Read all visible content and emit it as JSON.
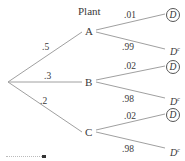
{
  "diagram": {
    "type": "probability-tree",
    "header": "Plant",
    "root_branches": [
      {
        "node": "A",
        "prob": ".5",
        "children": [
          {
            "label": "D",
            "circled": true,
            "prob": ".01"
          },
          {
            "label": "D",
            "sup": "c",
            "circled": false,
            "prob": ".99"
          }
        ]
      },
      {
        "node": "B",
        "prob": ".3",
        "children": [
          {
            "label": "D",
            "circled": true,
            "prob": ".02"
          },
          {
            "label": "D",
            "sup": "c",
            "circled": false,
            "prob": ".98"
          }
        ]
      },
      {
        "node": "C",
        "prob": ".2",
        "children": [
          {
            "label": "D",
            "circled": true,
            "prob": ".02"
          },
          {
            "label": "D",
            "sup": "c",
            "circled": false,
            "prob": ".98"
          }
        ]
      }
    ],
    "colors": {
      "line": "#9a9a9a",
      "text": "#333333"
    }
  }
}
